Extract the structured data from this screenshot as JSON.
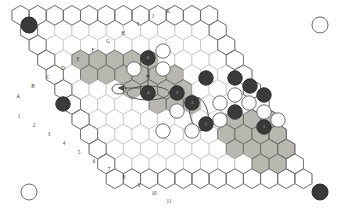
{
  "figure": {
    "board_shape": "rhombus",
    "background_color": "#ffffff",
    "grid_line_color": "#b5b5b5",
    "border_line_color": "#6d6d6d",
    "shaded_region_color": "#b8b8b0",
    "shaded_region_outline": "#5e5e5e",
    "dark_stone_color": "#3a3a3a",
    "light_stone_color": "#ffffff",
    "light_stone_outline": "#6d6d6d",
    "annotation_color": "#4a4a4a"
  },
  "edge_labels": {
    "letters_name": "upper-left-diagonal-letters",
    "letters": [
      "A",
      "B",
      "C",
      "D",
      "E",
      "F",
      "G",
      "H",
      "I",
      "J",
      "K"
    ],
    "numbers_name": "lower-left-diagonal-numbers",
    "numbers": [
      "1",
      "2",
      "3",
      "4",
      "5",
      "6",
      "7",
      "8",
      "9",
      "10",
      "11"
    ]
  },
  "letter_label_positions": [
    {
      "label": "A",
      "x": 18,
      "y": 97
    },
    {
      "label": "B",
      "x": 33,
      "y": 87
    },
    {
      "label": "C",
      "x": 48,
      "y": 78
    },
    {
      "label": "D",
      "x": 63,
      "y": 69
    },
    {
      "label": "E",
      "x": 78,
      "y": 60
    },
    {
      "label": "F",
      "x": 93,
      "y": 51
    },
    {
      "label": "G",
      "x": 108,
      "y": 42
    },
    {
      "label": "H",
      "x": 123,
      "y": 34
    },
    {
      "label": "I",
      "x": 138,
      "y": 25
    },
    {
      "label": "J",
      "x": 153,
      "y": 17
    },
    {
      "label": "K",
      "x": 168,
      "y": 12
    }
  ],
  "number_label_positions": [
    {
      "label": "1",
      "x": 19,
      "y": 117
    },
    {
      "label": "2",
      "x": 34,
      "y": 126
    },
    {
      "label": "3",
      "x": 49,
      "y": 135
    },
    {
      "label": "4",
      "x": 64,
      "y": 144
    },
    {
      "label": "5",
      "x": 79,
      "y": 153
    },
    {
      "label": "6",
      "x": 94,
      "y": 162
    },
    {
      "label": "7",
      "x": 109,
      "y": 170
    },
    {
      "label": "8",
      "x": 124,
      "y": 178
    },
    {
      "label": "9",
      "x": 139,
      "y": 186
    },
    {
      "label": "10",
      "x": 154,
      "y": 194
    },
    {
      "label": "11",
      "x": 169,
      "y": 202
    }
  ],
  "corner_stones": [
    {
      "name": "corner-stone-top-left",
      "color": "dark",
      "x": 29,
      "y": 25,
      "r": 8
    },
    {
      "name": "corner-stone-top-right",
      "color": "light",
      "x": 320,
      "y": 25,
      "r": 8
    },
    {
      "name": "corner-stone-bottom-left",
      "color": "light",
      "x": 29,
      "y": 192,
      "r": 8
    },
    {
      "name": "corner-stone-bottom-right",
      "color": "dark",
      "x": 320,
      "y": 192,
      "r": 8
    }
  ],
  "shaded_regions": [
    {
      "name": "shaded-region-upper-left",
      "hexes": [
        [
          2,
          3
        ],
        [
          3,
          3
        ],
        [
          4,
          3
        ],
        [
          5,
          3
        ],
        [
          6,
          3
        ],
        [
          2,
          4
        ],
        [
          3,
          4
        ],
        [
          4,
          4
        ],
        [
          5,
          4
        ],
        [
          6,
          4
        ],
        [
          7,
          4
        ],
        [
          4,
          5
        ],
        [
          5,
          5
        ],
        [
          6,
          5
        ],
        [
          7,
          5
        ],
        [
          5,
          6
        ],
        [
          6,
          6
        ],
        [
          7,
          6
        ]
      ]
    },
    {
      "name": "shaded-region-lower-right",
      "hexes": [
        [
          9,
          7
        ],
        [
          10,
          7
        ],
        [
          11,
          7
        ],
        [
          8,
          8
        ],
        [
          9,
          8
        ],
        [
          10,
          8
        ],
        [
          11,
          8
        ],
        [
          12,
          8
        ],
        [
          8,
          9
        ],
        [
          9,
          9
        ],
        [
          10,
          9
        ],
        [
          11,
          9
        ],
        [
          9,
          10
        ],
        [
          10,
          10
        ]
      ]
    }
  ],
  "stones": [
    {
      "name": "stone-dark-1",
      "color": "dark",
      "x": 63,
      "y": 104,
      "mark": ""
    },
    {
      "name": "stone-dark-2",
      "color": "dark",
      "x": 148,
      "y": 58,
      "mark": "6"
    },
    {
      "name": "stone-light-1",
      "color": "light",
      "x": 163,
      "y": 51,
      "mark": ""
    },
    {
      "name": "stone-light-2",
      "color": "light",
      "x": 134,
      "y": 69,
      "mark": ""
    },
    {
      "name": "stone-light-3",
      "color": "light",
      "x": 163,
      "y": 69,
      "mark": ""
    },
    {
      "name": "stone-dark-3",
      "color": "dark",
      "x": 148,
      "y": 93,
      "mark": "4"
    },
    {
      "name": "stone-dark-4",
      "color": "dark",
      "x": 177,
      "y": 93,
      "mark": "2"
    },
    {
      "name": "stone-dark-5",
      "color": "dark",
      "x": 192,
      "y": 103,
      "mark": "3"
    },
    {
      "name": "stone-dark-6",
      "color": "dark",
      "x": 206,
      "y": 78,
      "mark": ""
    },
    {
      "name": "stone-dark-7",
      "color": "dark",
      "x": 235,
      "y": 78,
      "mark": ""
    },
    {
      "name": "stone-dark-8",
      "color": "dark",
      "x": 250,
      "y": 86,
      "mark": ""
    },
    {
      "name": "stone-dark-9",
      "color": "dark",
      "x": 264,
      "y": 95,
      "mark": ""
    },
    {
      "name": "stone-light-4",
      "color": "light",
      "x": 235,
      "y": 95,
      "mark": ""
    },
    {
      "name": "stone-light-5",
      "color": "light",
      "x": 220,
      "y": 103,
      "mark": ""
    },
    {
      "name": "stone-light-6",
      "color": "light",
      "x": 249,
      "y": 103,
      "mark": ""
    },
    {
      "name": "stone-dark-10",
      "color": "dark",
      "x": 235,
      "y": 112,
      "mark": ""
    },
    {
      "name": "stone-light-7",
      "color": "light",
      "x": 264,
      "y": 112,
      "mark": ""
    },
    {
      "name": "stone-light-8",
      "color": "light",
      "x": 220,
      "y": 120,
      "mark": ""
    },
    {
      "name": "stone-light-9",
      "color": "light",
      "x": 278,
      "y": 120,
      "mark": ""
    },
    {
      "name": "stone-light-10",
      "color": "light",
      "x": 177,
      "y": 111,
      "mark": ""
    },
    {
      "name": "stone-light-11",
      "color": "light",
      "x": 163,
      "y": 131,
      "mark": ""
    },
    {
      "name": "stone-light-12",
      "color": "light",
      "x": 192,
      "y": 131,
      "mark": ""
    },
    {
      "name": "stone-dark-11",
      "color": "dark",
      "x": 206,
      "y": 124,
      "mark": "5"
    },
    {
      "name": "stone-dark-12",
      "color": "dark",
      "x": 264,
      "y": 127,
      "mark": "1"
    }
  ],
  "annotations": [
    {
      "name": "connector-vertical-upper",
      "type": "line",
      "x1": 148,
      "y1": 63,
      "x2": 148,
      "y2": 90
    },
    {
      "name": "connector-dot",
      "type": "dot",
      "x": 148,
      "y": 76,
      "r": 1.6
    },
    {
      "name": "arrow-left",
      "type": "arrow",
      "x1": 142,
      "y1": 88,
      "x2": 118,
      "y2": 88
    },
    {
      "name": "loop-center",
      "type": "loop",
      "x": 148,
      "y": 93,
      "rx": 21,
      "ry": 7,
      "rot": 0
    },
    {
      "name": "loop-right",
      "type": "loop",
      "x": 199,
      "y": 114,
      "rx": 9,
      "ry": 17,
      "rot": -12
    },
    {
      "name": "loop-left-small",
      "type": "loop",
      "x": 119,
      "y": 89,
      "rx": 7,
      "ry": 5,
      "rot": 0
    }
  ]
}
